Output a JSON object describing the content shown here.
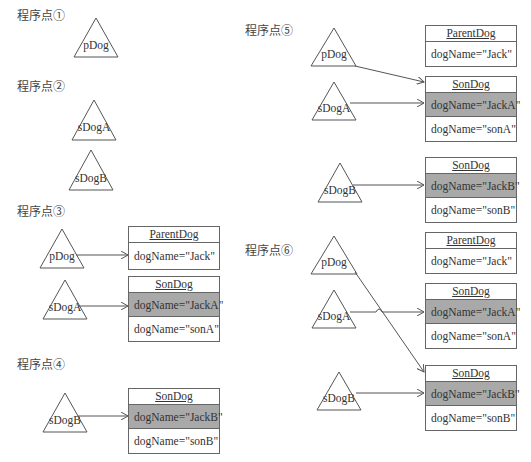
{
  "stages": [
    {
      "id": "1",
      "label": "程序点①",
      "x": 17,
      "y": 6
    },
    {
      "id": "2",
      "label": "程序点②",
      "x": 17,
      "y": 77
    },
    {
      "id": "3",
      "label": "程序点③",
      "x": 17,
      "y": 202
    },
    {
      "id": "4",
      "label": "程序点④",
      "x": 17,
      "y": 355
    },
    {
      "id": "5",
      "label": "程序点⑤",
      "x": 245,
      "y": 21
    },
    {
      "id": "6",
      "label": "程序点⑥",
      "x": 245,
      "y": 241
    }
  ],
  "references": {
    "pDog": "pDog",
    "sDogA": "sDogA",
    "sDogB": "sDogB"
  },
  "classes": {
    "parent": "ParentDog",
    "son": "SonDog"
  },
  "fields": {
    "jack": "dogName=\"Jack\"",
    "jackA": "dogName=\"JackA\"",
    "sonA": "dogName=\"sonA\"",
    "jackB": "dogName=\"JackB\"",
    "sonB": "dogName=\"sonB\""
  },
  "colors": {
    "line": "#555555",
    "shaded_field": "#a9a9a9",
    "border": "#666666"
  }
}
